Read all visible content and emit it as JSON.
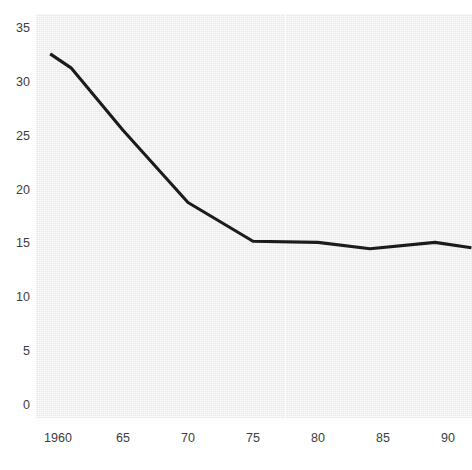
{
  "chart_data": {
    "type": "line",
    "title": "",
    "xlabel": "",
    "ylabel": "",
    "xlim": [
      1959.0,
      1991.8
    ],
    "ylim": [
      0,
      35
    ],
    "grid": false,
    "legend": null,
    "line_color": "#1b1b1b",
    "plot_background": "#eeeeef",
    "page_background": "#ffffff",
    "x_ticks": [
      "1960",
      "65",
      "70",
      "75",
      "80",
      "85",
      "90"
    ],
    "x_tick_values": [
      1960,
      1965,
      1970,
      1975,
      1980,
      1985,
      1990
    ],
    "y_ticks": [
      "0",
      "5",
      "10",
      "15",
      "20",
      "25",
      "30",
      "35"
    ],
    "y_tick_values": [
      0,
      5,
      10,
      15,
      20,
      25,
      30,
      35
    ],
    "series": [
      {
        "name": "series-1",
        "x": [
          1959.4,
          1961.0,
          1965.0,
          1970.0,
          1975.0,
          1980.0,
          1984.0,
          1989.0,
          1991.8
        ],
        "values": [
          32.6,
          31.3,
          25.5,
          18.8,
          15.2,
          15.1,
          14.5,
          15.1,
          14.6
        ]
      }
    ]
  }
}
